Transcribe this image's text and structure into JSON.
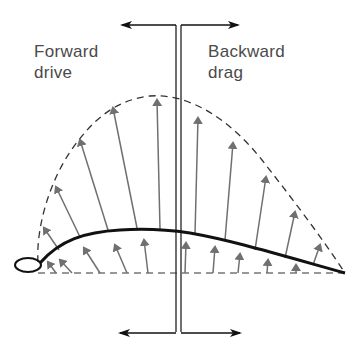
{
  "diagram": {
    "title": "",
    "labels": {
      "forward": {
        "line1": "Forward",
        "line2": "drive"
      },
      "backward": {
        "line1": "Backward",
        "line2": "drag"
      }
    },
    "colors": {
      "text": "#4a4a4a",
      "force_arrows": "#707070",
      "airfoil": "#111111",
      "envelope": "#333333",
      "axis_lines": "#222222",
      "background": "#ffffff"
    },
    "elements": [
      "pressure-envelope-dashed-curve",
      "airfoil-profile",
      "chord-line-dashed",
      "vertical-reference-double-line",
      "forward-direction-arrows",
      "backward-direction-arrows",
      "upper-surface-force-arrows",
      "lower-surface-force-arrows"
    ]
  }
}
